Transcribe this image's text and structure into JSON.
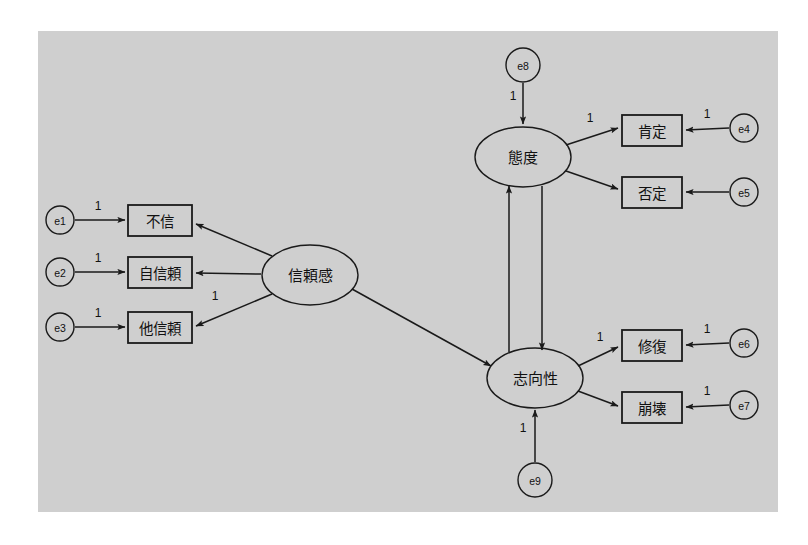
{
  "figure": {
    "type": "sem-path-diagram",
    "title": "",
    "panel": {
      "x": 38,
      "y": 31,
      "width": 740,
      "height": 481,
      "fill": "#cfcfcf"
    },
    "canvas": {
      "width": 808,
      "height": 545,
      "background": "#ffffff"
    },
    "line_color": "#1a1a1a"
  },
  "latent_variables": [
    {
      "id": "trust",
      "label": "信頼感",
      "cx": 310,
      "cy": 275,
      "rx": 48,
      "ry": 30
    },
    {
      "id": "attitude",
      "label": "態度",
      "cx": 523,
      "cy": 157,
      "rx": 48,
      "ry": 30
    },
    {
      "id": "orientation",
      "label": "志向性",
      "cx": 535,
      "cy": 378,
      "rx": 48,
      "ry": 30
    }
  ],
  "observed_variables": [
    {
      "id": "m1",
      "label": "不信",
      "x": 128,
      "y": 205,
      "width": 64,
      "height": 31
    },
    {
      "id": "m2",
      "label": "自信頼",
      "x": 128,
      "y": 257,
      "width": 64,
      "height": 31
    },
    {
      "id": "m3",
      "label": "他信頼",
      "x": 128,
      "y": 312,
      "width": 64,
      "height": 31
    },
    {
      "id": "m4",
      "label": "肯定",
      "x": 622,
      "y": 115,
      "width": 60,
      "height": 31
    },
    {
      "id": "m5",
      "label": "否定",
      "x": 622,
      "y": 177,
      "width": 60,
      "height": 31
    },
    {
      "id": "m6",
      "label": "修復",
      "x": 622,
      "y": 330,
      "width": 60,
      "height": 31
    },
    {
      "id": "m7",
      "label": "崩壊",
      "x": 622,
      "y": 392,
      "width": 60,
      "height": 31
    }
  ],
  "error_terms": [
    {
      "id": "e1",
      "label": "e1",
      "cx": 60,
      "cy": 220,
      "r": 14
    },
    {
      "id": "e2",
      "label": "e2",
      "cx": 60,
      "cy": 272,
      "r": 14
    },
    {
      "id": "e3",
      "label": "e3",
      "cx": 60,
      "cy": 327,
      "r": 14
    },
    {
      "id": "e4",
      "label": "e4",
      "cx": 744,
      "cy": 128,
      "r": 14
    },
    {
      "id": "e5",
      "label": "e5",
      "cx": 744,
      "cy": 192,
      "r": 14
    },
    {
      "id": "e6",
      "label": "e6",
      "cx": 744,
      "cy": 343,
      "r": 14
    },
    {
      "id": "e7",
      "label": "e7",
      "cx": 744,
      "cy": 405,
      "r": 14
    },
    {
      "id": "e8",
      "label": "e8",
      "cx": 523,
      "cy": 65,
      "r": 17
    },
    {
      "id": "e9",
      "label": "e9",
      "cx": 535,
      "cy": 480,
      "r": 17
    }
  ],
  "edges": [
    {
      "id": "e1-m1",
      "from": "e1",
      "to": "不信",
      "x1": 75,
      "y1": 220,
      "x2": 125,
      "y2": 220,
      "coef": "1",
      "lx": 98,
      "ly": 206
    },
    {
      "id": "e2-m2",
      "from": "e2",
      "to": "自信頼",
      "x1": 75,
      "y1": 272,
      "x2": 125,
      "y2": 272,
      "coef": "1",
      "lx": 98,
      "ly": 258
    },
    {
      "id": "e3-m3",
      "from": "e3",
      "to": "他信頼",
      "x1": 75,
      "y1": 327,
      "x2": 125,
      "y2": 327,
      "coef": "1",
      "lx": 98,
      "ly": 313
    },
    {
      "id": "trust-m1",
      "from": "信頼感",
      "to": "不信",
      "x1": 272,
      "y1": 256,
      "x2": 196,
      "y2": 224,
      "coef": "",
      "lx": 0,
      "ly": 0
    },
    {
      "id": "trust-m2",
      "from": "信頼感",
      "to": "自信頼",
      "x1": 261,
      "y1": 274,
      "x2": 196,
      "y2": 273,
      "coef": "",
      "lx": 0,
      "ly": 0
    },
    {
      "id": "trust-m3",
      "from": "信頼感",
      "to": "他信頼",
      "x1": 272,
      "y1": 294,
      "x2": 196,
      "y2": 326,
      "coef": "1",
      "lx": 215,
      "ly": 296
    },
    {
      "id": "trust-orientation",
      "from": "信頼感",
      "to": "志向性",
      "x1": 352,
      "y1": 289,
      "x2": 491,
      "y2": 366,
      "coef": "",
      "lx": 0,
      "ly": 0
    },
    {
      "id": "e8-attitude",
      "from": "e8",
      "to": "態度",
      "x1": 523,
      "y1": 83,
      "x2": 523,
      "y2": 124,
      "coef": "1",
      "lx": 513,
      "ly": 96
    },
    {
      "id": "attitude-m4",
      "from": "態度",
      "to": "肯定",
      "x1": 566,
      "y1": 145,
      "x2": 618,
      "y2": 128,
      "coef": "1",
      "lx": 590,
      "ly": 118
    },
    {
      "id": "attitude-m5",
      "from": "態度",
      "to": "否定",
      "x1": 566,
      "y1": 171,
      "x2": 618,
      "y2": 189,
      "coef": "",
      "lx": 0,
      "ly": 0
    },
    {
      "id": "e4-m4",
      "from": "e4",
      "to": "肯定",
      "x1": 729,
      "y1": 128,
      "x2": 686,
      "y2": 130,
      "coef": "1",
      "lx": 707,
      "ly": 114
    },
    {
      "id": "e5-m5",
      "from": "e5",
      "to": "否定",
      "x1": 729,
      "y1": 192,
      "x2": 686,
      "y2": 192,
      "coef": "",
      "lx": 0,
      "ly": 0
    },
    {
      "id": "orientation-attitude",
      "from": "志向性",
      "to": "態度",
      "x1": 509,
      "y1": 352,
      "x2": 509,
      "y2": 186,
      "coef": "",
      "lx": 0,
      "ly": 0
    },
    {
      "id": "attitude-orientation",
      "from": "態度",
      "to": "志向性",
      "x1": 542,
      "y1": 186,
      "x2": 542,
      "y2": 350,
      "coef": "",
      "lx": 0,
      "ly": 0
    },
    {
      "id": "e9-orientation",
      "from": "e9",
      "to": "志向性",
      "x1": 535,
      "y1": 462,
      "x2": 535,
      "y2": 410,
      "coef": "1",
      "lx": 523,
      "ly": 428
    },
    {
      "id": "orientation-m6",
      "from": "志向性",
      "to": "修復",
      "x1": 578,
      "y1": 366,
      "x2": 618,
      "y2": 347,
      "coef": "1",
      "lx": 600,
      "ly": 337
    },
    {
      "id": "orientation-m7",
      "from": "志向性",
      "to": "崩壊",
      "x1": 578,
      "y1": 391,
      "x2": 618,
      "y2": 406,
      "coef": "",
      "lx": 0,
      "ly": 0
    },
    {
      "id": "e6-m6",
      "from": "e6",
      "to": "修復",
      "x1": 729,
      "y1": 343,
      "x2": 686,
      "y2": 345,
      "coef": "1",
      "lx": 707,
      "ly": 329
    },
    {
      "id": "e7-m7",
      "from": "e7",
      "to": "崩壊",
      "x1": 729,
      "y1": 405,
      "x2": 686,
      "y2": 407,
      "coef": "1",
      "lx": 707,
      "ly": 391
    }
  ]
}
